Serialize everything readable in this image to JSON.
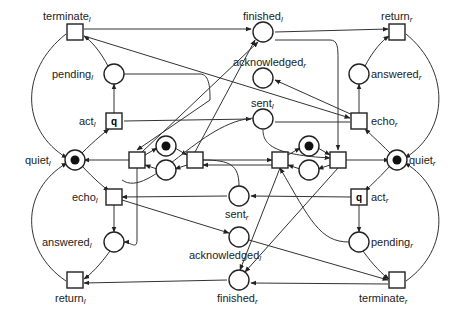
{
  "diagram": {
    "type": "petri-net",
    "places": [
      {
        "id": "finished_l",
        "label": "finished",
        "sub": "l",
        "x": 263,
        "y": 32,
        "tokens": 0
      },
      {
        "id": "acknowledged_r",
        "label": "acknowledged",
        "sub": "r",
        "x": 263,
        "y": 78,
        "tokens": 0
      },
      {
        "id": "sent_l",
        "label": "sent",
        "sub": "l",
        "x": 263,
        "y": 119,
        "tokens": 0
      },
      {
        "id": "pending_l",
        "label": "pending",
        "sub": "l",
        "x": 114,
        "y": 74,
        "tokens": 0
      },
      {
        "id": "answered_r",
        "label": "answered",
        "sub": "r",
        "x": 359,
        "y": 74,
        "tokens": 0
      },
      {
        "id": "quiet_l",
        "label": "quiet",
        "sub": "l",
        "x": 75,
        "y": 160,
        "tokens": 1
      },
      {
        "id": "quiet_r",
        "label": "quiet",
        "sub": "r",
        "x": 397,
        "y": 160,
        "tokens": 1
      },
      {
        "id": "mutex_l",
        "label": "",
        "sub": "",
        "x": 166,
        "y": 146,
        "tokens": 1
      },
      {
        "id": "free_l",
        "label": "",
        "sub": "",
        "x": 166,
        "y": 170,
        "tokens": 0
      },
      {
        "id": "mutex_r",
        "label": "",
        "sub": "",
        "x": 309,
        "y": 146,
        "tokens": 1
      },
      {
        "id": "free_r",
        "label": "",
        "sub": "",
        "x": 309,
        "y": 170,
        "tokens": 0
      },
      {
        "id": "sent_r",
        "label": "sent",
        "sub": "r",
        "x": 239,
        "y": 196,
        "tokens": 0
      },
      {
        "id": "acknowledged_l",
        "label": "acknowledged",
        "sub": "l",
        "x": 239,
        "y": 237,
        "tokens": 0
      },
      {
        "id": "finished_r",
        "label": "finished",
        "sub": "r",
        "x": 239,
        "y": 280,
        "tokens": 0
      },
      {
        "id": "answered_l",
        "label": "answered",
        "sub": "l",
        "x": 114,
        "y": 242,
        "tokens": 0
      },
      {
        "id": "pending_r",
        "label": "pending",
        "sub": "r",
        "x": 359,
        "y": 242,
        "tokens": 0
      }
    ],
    "transitions": [
      {
        "id": "terminate_l",
        "label": "terminate",
        "sub": "l",
        "x": 75,
        "y": 32
      },
      {
        "id": "act_l",
        "label": "act",
        "sub": "l",
        "x": 114,
        "y": 121,
        "inner": "q"
      },
      {
        "id": "enter_l",
        "label": "",
        "sub": "",
        "x": 137,
        "y": 160
      },
      {
        "id": "exit_l",
        "label": "",
        "sub": "",
        "x": 195,
        "y": 160
      },
      {
        "id": "echo_l",
        "label": "echo",
        "sub": "l",
        "x": 114,
        "y": 197
      },
      {
        "id": "return_l",
        "label": "return",
        "sub": "l",
        "x": 75,
        "y": 280
      },
      {
        "id": "return_r",
        "label": "return",
        "sub": "r",
        "x": 397,
        "y": 32
      },
      {
        "id": "echo_r",
        "label": "echo",
        "sub": "r",
        "x": 359,
        "y": 121
      },
      {
        "id": "enter_r",
        "label": "",
        "sub": "",
        "x": 338,
        "y": 160
      },
      {
        "id": "exit_r",
        "label": "",
        "sub": "",
        "x": 280,
        "y": 160
      },
      {
        "id": "act_r",
        "label": "act",
        "sub": "r",
        "x": 359,
        "y": 197,
        "inner": "q"
      },
      {
        "id": "terminate_r",
        "label": "terminate",
        "sub": "r",
        "x": 397,
        "y": 280
      }
    ]
  }
}
